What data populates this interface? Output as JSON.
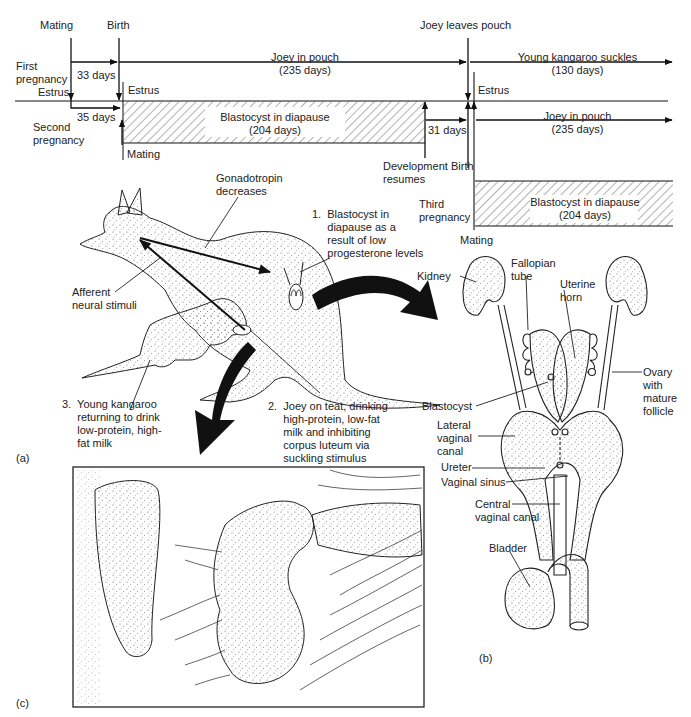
{
  "timeline": {
    "events_top": {
      "mating": "Mating",
      "birth": "Birth",
      "joey_leaves_pouch": "Joey leaves pouch"
    },
    "first_pregnancy": {
      "label": "First\npregnancy",
      "gestation": "33 days",
      "joey_in_pouch": "Joey in pouch\n(235 days)",
      "young_suckles": "Young kangaroo suckles\n(130 days)"
    },
    "estrus_labels": [
      "Estrus",
      "Estrus",
      "Estrus"
    ],
    "second_pregnancy": {
      "label": "Second\npregnancy",
      "interval": "35 days",
      "diapause": "Blastocyst in diapause\n(204 days)",
      "mating": "Mating",
      "development_interval": "31 days",
      "development_resumes": "Development\nresumes",
      "birth": "Birth",
      "joey_in_pouch": "Joey in pouch\n(235 days)"
    },
    "third_pregnancy": {
      "label": "Third\npregnancy",
      "diapause": "Blastocyst in diapause\n(204 days)",
      "mating": "Mating"
    }
  },
  "panel_a": {
    "id": "(a)",
    "gonadotropin": "Gonadotropin\ndecreases",
    "afferent": "Afferent\nneural stimuli",
    "note1": "1.  Blastocyst in\n     diapause as a\n     result of low\n     progesterone levels",
    "note2": "2.  Joey on teat, drinking\n     high-protein, low-fat\n     milk and inhibiting\n     corpus luteum via\n     suckling stimulus",
    "note3": "3.  Young kangaroo\n     returning to drink\n     low-protein, high-\n     fat milk"
  },
  "panel_b": {
    "id": "(b)",
    "labels": {
      "kidney": "Kidney",
      "fallopian": "Fallopian\ntube",
      "uterine_horn": "Uterine\nhorn",
      "ovary": "Ovary\nwith\nmature\nfollicle",
      "blastocyst": "Blastocyst",
      "lateral_canal": "Lateral\nvaginal\ncanal",
      "ureter": "Ureter",
      "vaginal_sinus": "Vaginal sinus",
      "central_canal": "Central\nvaginal canal",
      "bladder": "Bladder"
    }
  },
  "panel_c": {
    "id": "(c)"
  }
}
